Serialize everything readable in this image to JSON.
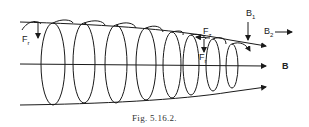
{
  "figure": {
    "caption": "Fig. 5.16.2.",
    "labels": {
      "Fr_left": {
        "main": "F",
        "sub": "r"
      },
      "Fz": {
        "main": "F",
        "sub": "z"
      },
      "Fr_mid": {
        "main": "F",
        "sub": "r"
      },
      "B1": {
        "main": "B",
        "sub": "1"
      },
      "B2": {
        "main": "B",
        "sub": "2"
      },
      "B": "B"
    },
    "colors": {
      "line": "#1a1a1a",
      "background": "#ffffff"
    }
  }
}
